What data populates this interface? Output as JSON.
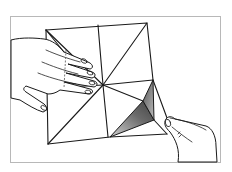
{
  "illustration": {
    "subject": "Hands folding a square sheet of paper along diagonal and center creases (origami step)",
    "style": "black-and-white line drawing",
    "colors": {
      "background": "#ffffff",
      "frame": "#b8b8b8",
      "ink": "#1a1a1a",
      "shade_dark": "#555555",
      "shade_light": "#bdbdbd"
    },
    "elements": [
      "frame",
      "paper-square",
      "creases",
      "left-hand",
      "right-hand",
      "shaded-fold-flap"
    ]
  }
}
